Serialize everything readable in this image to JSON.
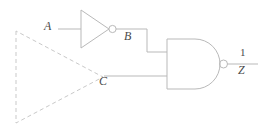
{
  "diagram": {
    "type": "logic-circuit-schematic",
    "background_color": "#ffffff",
    "wire_color": "#b9b9b9",
    "dashed_color": "#c9c9c9",
    "label_color": "#4a4a4a"
  },
  "labels": {
    "input_a": "A",
    "node_b": "B",
    "node_c": "C",
    "output_z": "Z",
    "output_value": "1"
  },
  "gates": [
    {
      "name": "inverter",
      "type": "NOT",
      "inputs": [
        "A"
      ],
      "output": "B",
      "bubble": true
    },
    {
      "name": "nand-gate",
      "type": "NAND",
      "inputs": [
        "B",
        "C"
      ],
      "output": "Z",
      "bubble": true
    }
  ],
  "nets": [
    {
      "name": "a-input-wire",
      "from": "A",
      "to": "inverter"
    },
    {
      "name": "b-wire",
      "from": "inverter",
      "to": "nand-gate-input-top"
    },
    {
      "name": "c-wire",
      "from": "C",
      "to": "nand-gate-input-bottom"
    },
    {
      "name": "z-output-wire",
      "from": "nand-gate",
      "to": "Z"
    }
  ],
  "annotation": {
    "name": "dashed-triangle",
    "style": "dashed",
    "description": "dashed triangle converging at node C"
  }
}
